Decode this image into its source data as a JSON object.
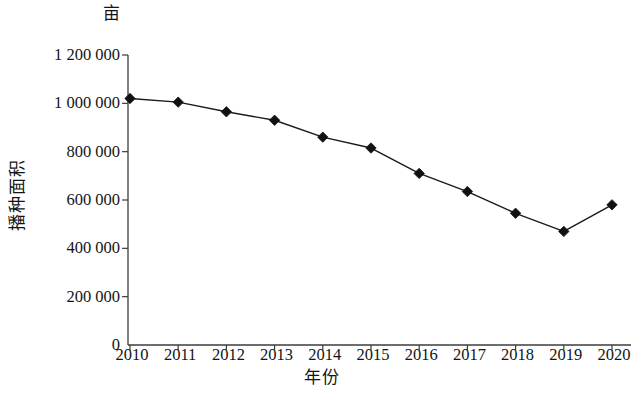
{
  "chart_data": {
    "type": "line",
    "title": "",
    "subtitle": "",
    "unit_label": "亩",
    "xlabel": "年份",
    "ylabel": "播种面积",
    "categories": [
      "2010",
      "2011",
      "2012",
      "2013",
      "2014",
      "2015",
      "2016",
      "2017",
      "2018",
      "2019",
      "2020"
    ],
    "x": [
      2010,
      2011,
      2012,
      2013,
      2014,
      2015,
      2016,
      2017,
      2018,
      2019,
      2020
    ],
    "values": [
      1020000,
      1005000,
      965000,
      930000,
      860000,
      815000,
      710000,
      635000,
      545000,
      470000,
      580000
    ],
    "series": [
      {
        "name": "播种面积",
        "values": [
          1020000,
          1005000,
          965000,
          930000,
          860000,
          815000,
          710000,
          635000,
          545000,
          470000,
          580000
        ]
      }
    ],
    "ylim": [
      0,
      1200000
    ],
    "ytick_labels": [
      "1 200 000",
      "1 000 000",
      "800 000",
      "600 000",
      "400 000",
      "200 000",
      "0"
    ],
    "ytick_values": [
      1200000,
      1000000,
      800000,
      600000,
      400000,
      200000,
      0
    ],
    "xlim": [
      2009.6,
      2020.6
    ],
    "grid": false,
    "legend": "none",
    "marker": "diamond",
    "line_color": "#1a1a1a",
    "marker_color": "#111111",
    "axis_color": "#3c3c3c",
    "background": "#ffffff"
  }
}
